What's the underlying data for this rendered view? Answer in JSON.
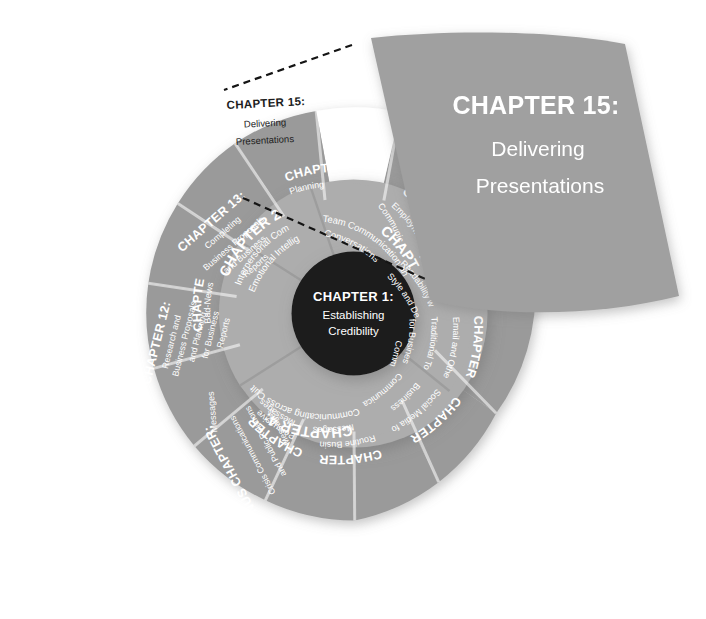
{
  "figure": {
    "type": "radial-chapter-wheel",
    "background_color": "#ffffff",
    "colors": {
      "outer_ring": "#9a9a9a",
      "inner_ring": "#adadad",
      "hub": "#1d1d1d",
      "highlight_segment": "#ffffff",
      "callout_panel": "#a0a0a0",
      "label_text": "#ffffff",
      "highlight_label_text": "#1d1d1d",
      "leader_line": "#141414"
    }
  },
  "hub": {
    "title": "CHAPTER 1:",
    "subtitle_line1": "Establishing",
    "subtitle_line2": "Credibility"
  },
  "inner_ring": [
    {
      "id": "chapter-2",
      "title": "CHAPTER 2:",
      "subtitle_line1": "Interpersonal Communication and",
      "subtitle_line2": "Emotional Intelligence"
    },
    {
      "id": "chapter-3",
      "title": "CHAPTER 3:",
      "subtitle_line1": "Team Communication and Difficult",
      "subtitle_line2": "Conversations"
    },
    {
      "id": "chapter-4",
      "title": "CHAPTER 4:",
      "subtitle_line1": "Communicating across Cultures",
      "subtitle_line2": ""
    }
  ],
  "outer_ring": [
    {
      "id": "chapter-6",
      "title": "CHAPTER 6:",
      "subtitle_line1": "Improving",
      "subtitle_line2": "Readability with",
      "subtitle_line3": "Style and Design"
    },
    {
      "id": "chapter-7",
      "title": "CHAPTER 7:",
      "subtitle_line1": "Email and Other",
      "subtitle_line2": "Traditional Tools",
      "subtitle_line3": "for Business",
      "subtitle_line4": "Communication"
    },
    {
      "id": "chapter-8",
      "title": "CHAPTER 8:",
      "subtitle_line1": "Social Media for",
      "subtitle_line2": "Business",
      "subtitle_line3": "Communication"
    },
    {
      "id": "chapter-9",
      "title": "CHAPTER 9:",
      "subtitle_line1": "Routine Business",
      "subtitle_line2": "Messages"
    },
    {
      "id": "chapter-10",
      "title": "CHAPTER 10:",
      "subtitle_line1": "Persuasive",
      "subtitle_line2": "Messages"
    },
    {
      "id": "bonus-chapter",
      "title": "BONUS CHAPTER:",
      "subtitle_line1": "Crisis Communications",
      "subtitle_line2": "and Public Relations",
      "subtitle_line3": "Messages"
    },
    {
      "id": "chapter-11",
      "title": "CHAPTER 11:",
      "subtitle_line1": "Bad-News",
      "subtitle_line2": "Messages"
    },
    {
      "id": "chapter-12",
      "title": "CHAPTER 12:",
      "subtitle_line1": "Research and",
      "subtitle_line2": "Business Proposals",
      "subtitle_line3": "and Planning",
      "subtitle_line4": "for Business",
      "subtitle_line5": "Reports"
    },
    {
      "id": "chapter-13",
      "title": "CHAPTER 13:",
      "subtitle_line1": "Completing",
      "subtitle_line2": "Business Proposals",
      "subtitle_line3": "and Business",
      "subtitle_line4": "Reports"
    },
    {
      "id": "chapter-14",
      "title": "CHAPTER 14:",
      "subtitle_line1": "Planning",
      "subtitle_line2": "Presentations"
    },
    {
      "id": "chapter-15",
      "title": "CHAPTER 15:",
      "subtitle_line1": "Delivering",
      "subtitle_line2": "Presentations",
      "highlighted": "yes"
    },
    {
      "id": "chapter-16",
      "title": "CHAPTER 16:",
      "subtitle_line1": "Employment",
      "subtitle_line2": "Communications"
    }
  ],
  "callout": {
    "title": "CHAPTER 15:",
    "subtitle_line1": "Delivering",
    "subtitle_line2": "Presentations"
  }
}
